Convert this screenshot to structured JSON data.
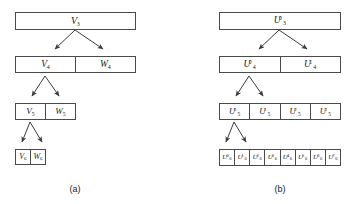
{
  "figure": {
    "background": "#ffffff",
    "box_border_color": "#4a4a4a",
    "arrow_color": "#3c3c3c",
    "text_color": "#1c1c1c"
  },
  "panels": [
    {
      "id": "a",
      "caption": "(a)",
      "type": "wavelet-multiresolution-decomposition",
      "levels": [
        {
          "level": 3,
          "cells": [
            {
              "label": "V",
              "sub": "3",
              "sup": ""
            }
          ]
        },
        {
          "level": 4,
          "cells": [
            {
              "label": "V",
              "sub": "4",
              "sup": ""
            },
            {
              "label": "W",
              "sub": "4",
              "sup": ""
            }
          ]
        },
        {
          "level": 5,
          "cells": [
            {
              "label": "V",
              "sub": "5",
              "sup": ""
            },
            {
              "label": "W",
              "sub": "5",
              "sup": ""
            }
          ]
        },
        {
          "level": 6,
          "cells": [
            {
              "label": "V",
              "sub": "6",
              "sup": ""
            },
            {
              "label": "W",
              "sub": "6",
              "sup": ""
            }
          ]
        }
      ],
      "arrows": [
        {
          "from_level": 3,
          "to_level": 4,
          "targets": 2
        },
        {
          "from_level": 4,
          "to_level": 5,
          "targets": 2
        },
        {
          "from_level": 5,
          "to_level": 6,
          "targets": 2
        }
      ]
    },
    {
      "id": "b",
      "caption": "(b)",
      "type": "wavelet-packet-decomposition",
      "levels": [
        {
          "level": 3,
          "cells": [
            {
              "label": "U",
              "sub": "3",
              "sup": "0"
            }
          ]
        },
        {
          "level": 4,
          "cells": [
            {
              "label": "U",
              "sub": "4",
              "sup": "0"
            },
            {
              "label": "U",
              "sub": "4",
              "sup": "1"
            }
          ]
        },
        {
          "level": 5,
          "cells": [
            {
              "label": "U",
              "sub": "5",
              "sup": "0"
            },
            {
              "label": "U",
              "sub": "5",
              "sup": "1"
            },
            {
              "label": "U",
              "sub": "5",
              "sup": "2"
            },
            {
              "label": "U",
              "sub": "5",
              "sup": "3"
            }
          ]
        },
        {
          "level": 6,
          "cells": [
            {
              "label": "U",
              "sub": "6",
              "sup": "0"
            },
            {
              "label": "U",
              "sub": "6",
              "sup": "1"
            },
            {
              "label": "U",
              "sub": "6",
              "sup": "2"
            },
            {
              "label": "U",
              "sub": "6",
              "sup": "3"
            },
            {
              "label": "U",
              "sub": "6",
              "sup": "4"
            },
            {
              "label": "U",
              "sub": "6",
              "sup": "5"
            },
            {
              "label": "U",
              "sub": "6",
              "sup": "6"
            },
            {
              "label": "U",
              "sub": "6",
              "sup": "7"
            }
          ]
        }
      ],
      "arrows": [
        {
          "from_level": 3,
          "to_level": 4,
          "targets": 2
        },
        {
          "from_level": 4,
          "to_level": 5,
          "targets": 2
        },
        {
          "from_level": 5,
          "to_level": 6,
          "targets": 2
        }
      ]
    }
  ]
}
